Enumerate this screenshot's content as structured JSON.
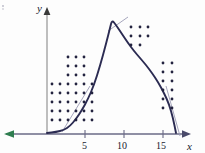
{
  "figure": {
    "title": "",
    "background_color": "#fdfdfd"
  },
  "axes": {
    "x_axis": {
      "label": "x",
      "color": "#4a4a6a",
      "arrow_right": true,
      "arrow_left": true,
      "left_arrow_color": "#2e7d4f",
      "ticks": [
        {
          "value": "5",
          "x": 85
        },
        {
          "value": "10",
          "x": 124
        },
        {
          "value": "15",
          "x": 163
        }
      ],
      "baseline_y": 134,
      "range": [
        0,
        19
      ]
    },
    "y_axis": {
      "label": "y",
      "color": "#9a9a9a",
      "arrow_up": true,
      "x_position": 47,
      "top_y": 8
    }
  },
  "curve": {
    "name": "density-curve",
    "color": "#2b2b52",
    "stroke_width": 1.9,
    "peak": {
      "x": 8.5,
      "y_px": 20
    },
    "x_intercept_right": 17.5,
    "description": "skewed unimodal curve rising from near zero, peaking near x=8.5 then falling steeply to the axis near x=17.5"
  },
  "tangent_lines": [
    {
      "name": "tangent-left",
      "color": "#8a8aa8"
    },
    {
      "name": "tangent-peak",
      "color": "#8a8aa8"
    },
    {
      "name": "tangent-right",
      "color": "#8a8aa8"
    }
  ],
  "chart_data": {
    "type": "scatter",
    "title": "",
    "xlabel": "x",
    "ylabel": "y",
    "xlim": [
      0,
      19
    ],
    "ylim": [
      0,
      1
    ],
    "grid": false,
    "legend": false,
    "dot_color": "#23233f",
    "dot_radius": 1.4,
    "curve": {
      "type": "line",
      "color": "#2b2b52",
      "points_px": [
        [
          47,
          133
        ],
        [
          56,
          132
        ],
        [
          64,
          130
        ],
        [
          70,
          126
        ],
        [
          76,
          119
        ],
        [
          82,
          110
        ],
        [
          88,
          99
        ],
        [
          94,
          85
        ],
        [
          100,
          66
        ],
        [
          106,
          44
        ],
        [
          110,
          28
        ],
        [
          112,
          20
        ],
        [
          116,
          25
        ],
        [
          122,
          34
        ],
        [
          128,
          43
        ],
        [
          134,
          51
        ],
        [
          140,
          58
        ],
        [
          146,
          65
        ],
        [
          152,
          73
        ],
        [
          158,
          82
        ],
        [
          164,
          93
        ],
        [
          169,
          104
        ],
        [
          173,
          118
        ],
        [
          176,
          133
        ]
      ]
    },
    "dots_px": [
      [
        68,
        57
      ],
      [
        76,
        57
      ],
      [
        84,
        57
      ],
      [
        68,
        66
      ],
      [
        76,
        66
      ],
      [
        84,
        66
      ],
      [
        68,
        75
      ],
      [
        76,
        75
      ],
      [
        84,
        75
      ],
      [
        52,
        84
      ],
      [
        60,
        84
      ],
      [
        68,
        84
      ],
      [
        76,
        84
      ],
      [
        84,
        84
      ],
      [
        92,
        84
      ],
      [
        52,
        93
      ],
      [
        60,
        93
      ],
      [
        68,
        93
      ],
      [
        76,
        93
      ],
      [
        84,
        93
      ],
      [
        92,
        93
      ],
      [
        52,
        102
      ],
      [
        60,
        102
      ],
      [
        68,
        102
      ],
      [
        76,
        102
      ],
      [
        84,
        102
      ],
      [
        92,
        102
      ],
      [
        52,
        111
      ],
      [
        60,
        111
      ],
      [
        68,
        111
      ],
      [
        76,
        111
      ],
      [
        84,
        111
      ],
      [
        92,
        111
      ],
      [
        52,
        120
      ],
      [
        60,
        120
      ],
      [
        68,
        120
      ],
      [
        76,
        120
      ],
      [
        84,
        120
      ],
      [
        92,
        120
      ],
      [
        131,
        27
      ],
      [
        140,
        27
      ],
      [
        148,
        27
      ],
      [
        131,
        36
      ],
      [
        140,
        36
      ],
      [
        148,
        36
      ],
      [
        131,
        45
      ],
      [
        140,
        45
      ],
      [
        163,
        63
      ],
      [
        172,
        63
      ],
      [
        163,
        72
      ],
      [
        172,
        72
      ],
      [
        163,
        81
      ],
      [
        172,
        81
      ],
      [
        163,
        90
      ],
      [
        172,
        90
      ],
      [
        163,
        99
      ],
      [
        172,
        99
      ],
      [
        163,
        108
      ],
      [
        172,
        108
      ]
    ],
    "annotations": [
      {
        "text": "y",
        "x_px": 37,
        "y_px": 10,
        "style": "italic"
      },
      {
        "text": "x",
        "x_px": 190,
        "y_px": 146,
        "style": "italic"
      },
      {
        "text": "5",
        "x_px": 82,
        "y_px": 147
      },
      {
        "text": "10",
        "x_px": 119,
        "y_px": 147
      },
      {
        "text": "15",
        "x_px": 159,
        "y_px": 147
      }
    ]
  }
}
